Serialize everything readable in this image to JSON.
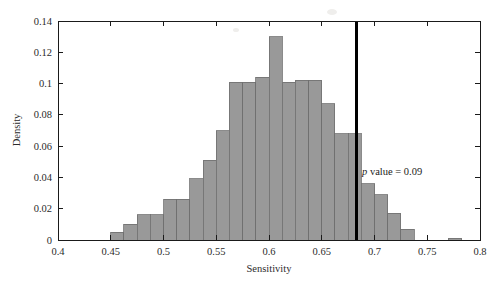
{
  "chart_data": {
    "type": "bar",
    "title": "",
    "subtitle": "",
    "xlabel": "Sensitivity",
    "ylabel": "Density",
    "xlim": [
      0.4,
      0.8
    ],
    "ylim": [
      0,
      0.14
    ],
    "grid": false,
    "legend": null,
    "bin_width": 0.0125,
    "x_ticks": [
      0.4,
      0.45,
      0.5,
      0.55,
      0.6,
      0.65,
      0.7,
      0.75,
      0.8
    ],
    "x_tick_labels": [
      "0.4",
      "0.45",
      "0.5",
      "0.55",
      "0.6",
      "0.65",
      "0.7",
      "0.75",
      "0.8"
    ],
    "y_ticks": [
      0,
      0.02,
      0.04,
      0.06,
      0.08,
      0.1,
      0.12,
      0.14
    ],
    "y_tick_labels": [
      "0",
      "0.02",
      "0.04",
      "0.06",
      "0.08",
      "0.1",
      "0.12",
      "0.14"
    ],
    "bar_fill_color": "#999999",
    "bar_edge_color": "#6e6e6e",
    "bins": [
      {
        "x0": 0.45,
        "x1": 0.4625,
        "value": 0.005
      },
      {
        "x0": 0.4625,
        "x1": 0.475,
        "value": 0.01
      },
      {
        "x0": 0.475,
        "x1": 0.4875,
        "value": 0.016
      },
      {
        "x0": 0.4875,
        "x1": 0.5,
        "value": 0.016
      },
      {
        "x0": 0.5,
        "x1": 0.5125,
        "value": 0.026
      },
      {
        "x0": 0.5125,
        "x1": 0.525,
        "value": 0.026
      },
      {
        "x0": 0.525,
        "x1": 0.5375,
        "value": 0.039
      },
      {
        "x0": 0.5375,
        "x1": 0.55,
        "value": 0.051
      },
      {
        "x0": 0.55,
        "x1": 0.5625,
        "value": 0.07
      },
      {
        "x0": 0.5625,
        "x1": 0.575,
        "value": 0.101
      },
      {
        "x0": 0.575,
        "x1": 0.5875,
        "value": 0.101
      },
      {
        "x0": 0.5875,
        "x1": 0.6,
        "value": 0.104
      },
      {
        "x0": 0.6,
        "x1": 0.6125,
        "value": 0.13
      },
      {
        "x0": 0.6125,
        "x1": 0.625,
        "value": 0.101
      },
      {
        "x0": 0.625,
        "x1": 0.6375,
        "value": 0.102
      },
      {
        "x0": 0.6375,
        "x1": 0.65,
        "value": 0.102
      },
      {
        "x0": 0.65,
        "x1": 0.6625,
        "value": 0.087
      },
      {
        "x0": 0.6625,
        "x1": 0.675,
        "value": 0.068
      },
      {
        "x0": 0.675,
        "x1": 0.6875,
        "value": 0.068
      },
      {
        "x0": 0.6875,
        "x1": 0.7,
        "value": 0.036
      },
      {
        "x0": 0.7,
        "x1": 0.7125,
        "value": 0.029
      },
      {
        "x0": 0.7125,
        "x1": 0.725,
        "value": 0.017
      },
      {
        "x0": 0.725,
        "x1": 0.7375,
        "value": 0.007
      },
      {
        "x0": 0.77,
        "x1": 0.7825,
        "value": 0.001
      }
    ],
    "vertical_line": {
      "x": 0.683,
      "color": "#000000",
      "label": "p value = 0.09",
      "label_italic_prefix": "p",
      "label_rest": " value = 0.09"
    }
  }
}
